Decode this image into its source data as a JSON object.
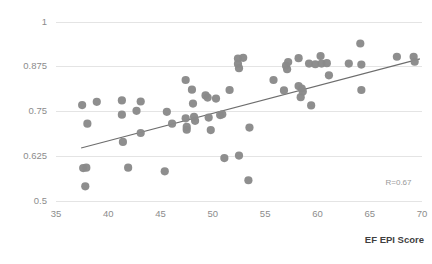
{
  "chart_data": {
    "type": "scatter",
    "title": "",
    "xlabel": "EF EPI Score",
    "ylabel": "",
    "xlim": [
      35,
      70
    ],
    "ylim": [
      0.5,
      1.0
    ],
    "xticks": [
      35,
      40,
      45,
      50,
      55,
      60,
      65,
      70
    ],
    "xticklabels": [
      "35",
      "40",
      "45",
      "50",
      "55",
      "60",
      "65",
      "70"
    ],
    "yticks": [
      0.5,
      0.625,
      0.75,
      0.875,
      1
    ],
    "yticklabels": [
      "0.5",
      "0.625",
      "0.75",
      "0.875",
      "1"
    ],
    "grid": "horizontal",
    "legend": "none",
    "marker_color": "#8a8a8a",
    "trendline_color": "#6d6d6d",
    "gridline_color": "#e4e4e4",
    "annotations": [
      {
        "text": "R=0.67",
        "x": 69.0,
        "y": 0.545
      }
    ],
    "trendline": {
      "x0": 37.4,
      "y0": 0.648,
      "x1": 69.8,
      "y1": 0.897
    },
    "points": [
      {
        "x": 37.5,
        "y": 0.768
      },
      {
        "x": 37.6,
        "y": 0.592
      },
      {
        "x": 37.9,
        "y": 0.593
      },
      {
        "x": 38.0,
        "y": 0.716
      },
      {
        "x": 37.8,
        "y": 0.541
      },
      {
        "x": 38.9,
        "y": 0.777
      },
      {
        "x": 41.3,
        "y": 0.781
      },
      {
        "x": 41.3,
        "y": 0.741
      },
      {
        "x": 41.4,
        "y": 0.665
      },
      {
        "x": 41.9,
        "y": 0.593
      },
      {
        "x": 42.7,
        "y": 0.752
      },
      {
        "x": 43.1,
        "y": 0.778
      },
      {
        "x": 43.1,
        "y": 0.69
      },
      {
        "x": 45.4,
        "y": 0.583
      },
      {
        "x": 45.6,
        "y": 0.749
      },
      {
        "x": 46.1,
        "y": 0.716
      },
      {
        "x": 47.4,
        "y": 0.838
      },
      {
        "x": 47.4,
        "y": 0.731
      },
      {
        "x": 47.5,
        "y": 0.699
      },
      {
        "x": 47.5,
        "y": 0.707
      },
      {
        "x": 48.0,
        "y": 0.811
      },
      {
        "x": 48.1,
        "y": 0.772
      },
      {
        "x": 48.2,
        "y": 0.735
      },
      {
        "x": 48.3,
        "y": 0.724
      },
      {
        "x": 49.3,
        "y": 0.795
      },
      {
        "x": 49.5,
        "y": 0.789
      },
      {
        "x": 49.6,
        "y": 0.733
      },
      {
        "x": 49.8,
        "y": 0.698
      },
      {
        "x": 50.3,
        "y": 0.786
      },
      {
        "x": 50.7,
        "y": 0.74
      },
      {
        "x": 50.9,
        "y": 0.742
      },
      {
        "x": 51.1,
        "y": 0.62
      },
      {
        "x": 51.6,
        "y": 0.81
      },
      {
        "x": 52.4,
        "y": 0.898
      },
      {
        "x": 52.4,
        "y": 0.883
      },
      {
        "x": 52.5,
        "y": 0.871
      },
      {
        "x": 52.5,
        "y": 0.627
      },
      {
        "x": 52.9,
        "y": 0.9
      },
      {
        "x": 53.5,
        "y": 0.705
      },
      {
        "x": 53.4,
        "y": 0.558
      },
      {
        "x": 55.8,
        "y": 0.838
      },
      {
        "x": 56.8,
        "y": 0.809
      },
      {
        "x": 57.0,
        "y": 0.878
      },
      {
        "x": 57.1,
        "y": 0.868
      },
      {
        "x": 57.2,
        "y": 0.888
      },
      {
        "x": 58.2,
        "y": 0.899
      },
      {
        "x": 58.2,
        "y": 0.821
      },
      {
        "x": 58.4,
        "y": 0.79
      },
      {
        "x": 58.5,
        "y": 0.814
      },
      {
        "x": 58.6,
        "y": 0.806
      },
      {
        "x": 59.2,
        "y": 0.884
      },
      {
        "x": 59.4,
        "y": 0.767
      },
      {
        "x": 59.8,
        "y": 0.882
      },
      {
        "x": 60.3,
        "y": 0.905
      },
      {
        "x": 60.4,
        "y": 0.884
      },
      {
        "x": 60.9,
        "y": 0.885
      },
      {
        "x": 61.1,
        "y": 0.851
      },
      {
        "x": 63.0,
        "y": 0.884
      },
      {
        "x": 64.1,
        "y": 0.94
      },
      {
        "x": 64.2,
        "y": 0.881
      },
      {
        "x": 64.2,
        "y": 0.81
      },
      {
        "x": 67.6,
        "y": 0.903
      },
      {
        "x": 69.2,
        "y": 0.903
      },
      {
        "x": 69.3,
        "y": 0.889
      }
    ]
  },
  "axis": {
    "x_title": "EF EPI Score",
    "r_annotation": "R=0.67"
  }
}
